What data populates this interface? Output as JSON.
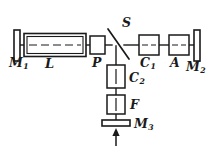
{
  "figure": {
    "background_color": "#ffffff",
    "stroke_color": "#1a1a1a"
  },
  "labels": {
    "m1": {
      "base": "M",
      "sub": "1",
      "name": "mirror-1"
    },
    "l": {
      "base": "L",
      "sub": "",
      "name": "laser-tube"
    },
    "p": {
      "base": "P",
      "sub": "",
      "name": "polarizer"
    },
    "s": {
      "base": "S",
      "sub": "",
      "name": "beamsplitter"
    },
    "c1": {
      "base": "C",
      "sub": "1",
      "name": "cell-1"
    },
    "a": {
      "base": "A",
      "sub": "",
      "name": "attenuator"
    },
    "m2": {
      "base": "M",
      "sub": "2",
      "name": "mirror-2"
    },
    "c2": {
      "base": "C",
      "sub": "2",
      "name": "cell-2"
    },
    "f": {
      "base": "F",
      "sub": "",
      "name": "filter"
    },
    "m3": {
      "base": "M",
      "sub": "3",
      "name": "mirror-3"
    }
  },
  "axes": {
    "horizontal_y": 45,
    "vertical_x": 116
  },
  "components": [
    {
      "id": "m1",
      "type": "mirror-bar-vertical",
      "x": 14,
      "y": 30,
      "w": 6,
      "h": 31
    },
    {
      "id": "l",
      "type": "tube-double-wall",
      "x": 24,
      "y": 34,
      "w": 62,
      "h": 22
    },
    {
      "id": "p",
      "type": "box-plain",
      "x": 89,
      "y": 36,
      "w": 17,
      "h": 18
    },
    {
      "id": "s",
      "type": "beamsplitter-diagonal",
      "x1": 108,
      "y1": 30,
      "x2": 128,
      "y2": 58
    },
    {
      "id": "c1",
      "type": "box-dashed-center",
      "x": 138,
      "y": 35,
      "w": 22,
      "h": 20
    },
    {
      "id": "a",
      "type": "box-dashed-center",
      "x": 168,
      "y": 35,
      "w": 22,
      "h": 20
    },
    {
      "id": "m2",
      "type": "mirror-bar-vertical",
      "x": 192,
      "y": 30,
      "w": 6,
      "h": 31
    },
    {
      "id": "c2",
      "type": "box-vert-center",
      "x": 107,
      "y": 66,
      "w": 18,
      "h": 22
    },
    {
      "id": "f",
      "type": "box-vert-center",
      "x": 107,
      "y": 95,
      "w": 18,
      "h": 19
    },
    {
      "id": "m3",
      "type": "mirror-bar-horizontal",
      "x": 102,
      "y": 120,
      "w": 28,
      "h": 6
    }
  ],
  "beam_arrow": {
    "name": "input-beam-arrow",
    "direction": "up",
    "x": 116,
    "y_from": 146,
    "y_to": 128
  }
}
